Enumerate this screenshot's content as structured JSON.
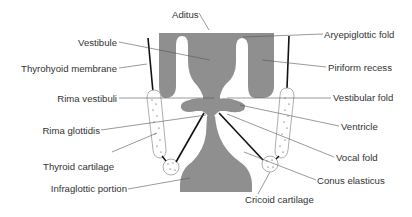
{
  "diagram": {
    "colors": {
      "tissue": "#8f8f8f",
      "cartilage_fill": "#ffffff",
      "cartilage_outline": "#999999",
      "ligament": "#111111",
      "leader": "#555555",
      "text": "#333333"
    },
    "labels": {
      "aditus": "Aditus",
      "vestibule": "Vestibule",
      "thyrohyoid_membrane": "Thyrohyoid membrane",
      "rima_vestibuli": "Rima vestibuli",
      "rima_glottidis": "Rima glottidis",
      "thyroid_cartilage": "Thyroid cartilage",
      "infraglottic_portion": "Infraglottic portion",
      "aryepiglottic_fold": "Aryepiglottic fold",
      "piriform_recess": "Piriform recess",
      "vestibular_fold": "Vestibular fold",
      "ventricle": "Ventricle",
      "vocal_fold": "Vocal fold",
      "conus_elasticus": "Conus elasticus",
      "cricoid_cartilage": "Cricoid cartilage"
    },
    "caption_fragment": "... the larynx ... The lumen of the l..."
  }
}
